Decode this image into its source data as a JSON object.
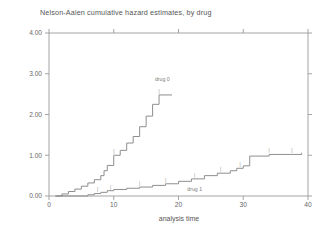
{
  "chart_data": {
    "type": "line",
    "title": "Nelson-Aalen cumulative hazard estimates, by drug",
    "xlabel": "analysis time",
    "ylabel": "",
    "xlim": [
      0,
      40
    ],
    "ylim": [
      0,
      4.0
    ],
    "xticks": [
      0,
      10,
      20,
      30,
      40
    ],
    "xtick_labels": [
      "0",
      "10",
      "20",
      "30",
      "40"
    ],
    "yticks": [
      0.0,
      1.0,
      2.0,
      3.0,
      4.0
    ],
    "ytick_labels": [
      "0.00",
      "1.00",
      "2.00",
      "3.00",
      "4.00"
    ],
    "grid": false,
    "legend_position": "inline-annotation",
    "series": [
      {
        "name": "drug 0",
        "label": "drug 0",
        "label_x": 17.5,
        "label_y": 2.82,
        "steps": [
          [
            1.0,
            0.0
          ],
          [
            2.0,
            0.05
          ],
          [
            3.0,
            0.11
          ],
          [
            4.0,
            0.17
          ],
          [
            5.0,
            0.24
          ],
          [
            6.0,
            0.32
          ],
          [
            7.0,
            0.4
          ],
          [
            8.0,
            0.5
          ],
          [
            8.5,
            0.62
          ],
          [
            9.0,
            0.75
          ],
          [
            10.0,
            1.0
          ],
          [
            11.0,
            1.12
          ],
          [
            12.0,
            1.3
          ],
          [
            13.0,
            1.46
          ],
          [
            14.0,
            1.7
          ],
          [
            15.0,
            1.96
          ],
          [
            16.0,
            2.25
          ],
          [
            17.0,
            2.48
          ],
          [
            19.0,
            2.48
          ]
        ],
        "censor_times": [
          10.0,
          17.0
        ]
      },
      {
        "name": "drug 1",
        "label": "drug 1",
        "label_x": 22.5,
        "label_y": 0.12,
        "steps": [
          [
            1.0,
            0.0
          ],
          [
            6.0,
            0.03
          ],
          [
            7.0,
            0.06
          ],
          [
            8.0,
            0.09
          ],
          [
            9.0,
            0.13
          ],
          [
            10.0,
            0.16
          ],
          [
            12.0,
            0.19
          ],
          [
            14.0,
            0.22
          ],
          [
            16.0,
            0.26
          ],
          [
            18.0,
            0.3
          ],
          [
            20.0,
            0.36
          ],
          [
            22.0,
            0.42
          ],
          [
            24.0,
            0.5
          ],
          [
            26.0,
            0.56
          ],
          [
            28.0,
            0.62
          ],
          [
            29.0,
            0.68
          ],
          [
            30.0,
            0.74
          ],
          [
            31.0,
            0.98
          ],
          [
            34.0,
            1.02
          ],
          [
            39.0,
            1.06
          ]
        ],
        "censor_times": [
          7.5,
          9.5,
          14.0,
          18.0,
          22.5,
          26.5,
          29.5,
          34.0,
          37.5
        ]
      }
    ]
  }
}
